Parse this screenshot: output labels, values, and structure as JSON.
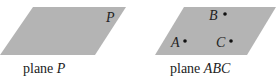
{
  "planes": [
    {
      "id": "P",
      "label": "P",
      "caption_prefix": "plane ",
      "caption_name": "P",
      "points": []
    },
    {
      "id": "ABC",
      "label": "",
      "caption_prefix": "plane ",
      "caption_name": "ABC",
      "points": [
        {
          "name": "A"
        },
        {
          "name": "B"
        },
        {
          "name": "C"
        }
      ]
    }
  ],
  "colors": {
    "plane_fill": "#b4b4b4",
    "text": "#222222",
    "point": "#111111"
  }
}
